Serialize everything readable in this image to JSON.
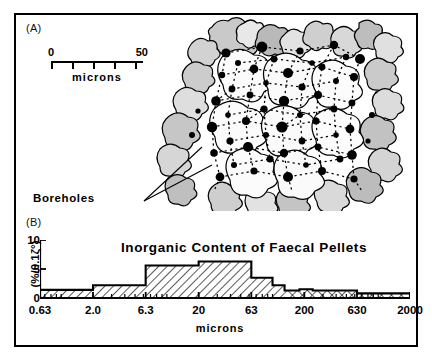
{
  "figure": {
    "panel_a": {
      "label": "(A)",
      "scalebar": {
        "start": "0",
        "end": "50",
        "unit": "microns",
        "divisions": 5
      },
      "annotation": "Boreholes",
      "legend_note": "black dots = boreholes connected by dotted burrow network over grain outlines"
    },
    "panel_b": {
      "label": "(B)"
    }
  },
  "chart_data": {
    "type": "bar",
    "title": "Inorganic Content of Faecal Pellets",
    "xlabel": "microns",
    "ylabel": "(%/0.1ζ°)",
    "xscale": "log",
    "xtick_labels": [
      "0.63",
      "2.0",
      "6.3",
      "20",
      "63",
      "200",
      "630",
      "2000"
    ],
    "xtick_values": [
      0.63,
      2.0,
      6.3,
      20,
      63,
      200,
      630,
      2000
    ],
    "ytick_labels": [
      "0",
      "5",
      "10"
    ],
    "ylim": [
      0,
      10
    ],
    "grid": false,
    "legend": "none",
    "bins": [
      {
        "from": 0.63,
        "to": 2.0,
        "value": 1.4,
        "fill": "hatch"
      },
      {
        "from": 2.0,
        "to": 6.3,
        "value": 2.2,
        "fill": "hatch"
      },
      {
        "from": 6.3,
        "to": 20,
        "value": 5.6,
        "fill": "hatch"
      },
      {
        "from": 20,
        "to": 63,
        "value": 6.3,
        "fill": "hatch"
      },
      {
        "from": 63,
        "to": 100,
        "value": 3.5,
        "fill": "hatch"
      },
      {
        "from": 100,
        "to": 130,
        "value": 2.2,
        "fill": "hatch"
      },
      {
        "from": 130,
        "to": 180,
        "value": 1.3,
        "fill": "crosshatch"
      },
      {
        "from": 180,
        "to": 240,
        "value": 1.5,
        "fill": "crosshatch"
      },
      {
        "from": 240,
        "to": 630,
        "value": 1.3,
        "fill": "crosshatch"
      },
      {
        "from": 630,
        "to": 2000,
        "value": 0.8,
        "fill": "crosshatch"
      }
    ]
  }
}
